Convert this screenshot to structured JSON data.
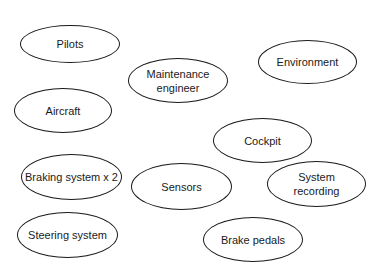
{
  "diagram": {
    "nodes": [
      {
        "id": "pilots",
        "label": "Pilots"
      },
      {
        "id": "maintenance-engineer",
        "label": "Maintenance\nengineer"
      },
      {
        "id": "environment",
        "label": "Environment"
      },
      {
        "id": "aircraft",
        "label": "Aircraft"
      },
      {
        "id": "cockpit",
        "label": "Cockpit"
      },
      {
        "id": "braking-system",
        "label": "Braking system x 2"
      },
      {
        "id": "sensors",
        "label": "Sensors"
      },
      {
        "id": "system-recording",
        "label": "System\nrecording"
      },
      {
        "id": "steering-system",
        "label": "Steering system"
      },
      {
        "id": "brake-pedals",
        "label": "Brake pedals"
      }
    ]
  }
}
